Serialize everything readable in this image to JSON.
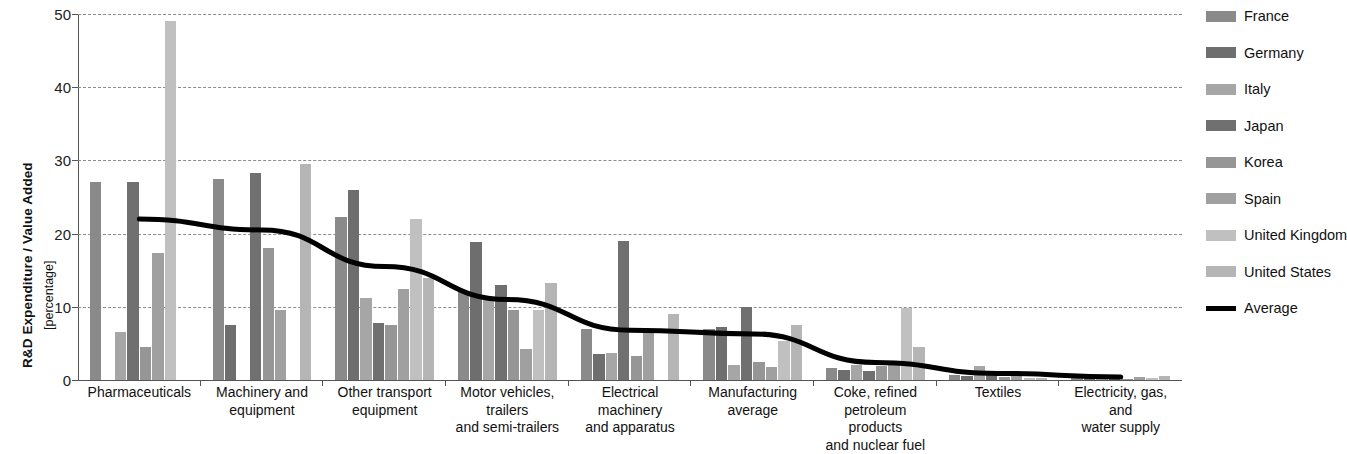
{
  "axis": {
    "y_title_main": "R&D Expenditure / Value Added",
    "y_title_sub": "[percentage]",
    "y_ticks": [
      "0",
      "10",
      "20",
      "30",
      "40",
      "50"
    ]
  },
  "legend": {
    "items": [
      {
        "label": "France",
        "color": "#8a8a8a"
      },
      {
        "label": "Germany",
        "color": "#6e6e6e"
      },
      {
        "label": "Italy",
        "color": "#a6a6a6"
      },
      {
        "label": "Japan",
        "color": "#707070"
      },
      {
        "label": "Korea",
        "color": "#969696"
      },
      {
        "label": "Spain",
        "color": "#a0a0a0"
      },
      {
        "label": "United Kingdom",
        "color": "#c0c0c0"
      },
      {
        "label": "United States",
        "color": "#b5b5b5"
      },
      {
        "label": "Average",
        "color": "#000000"
      }
    ]
  },
  "chart_data": {
    "type": "bar",
    "title": "",
    "xlabel": "",
    "ylabel": "R&D Expenditure / Value Added [percentage]",
    "ylim": [
      0,
      50
    ],
    "ytick_step": 10,
    "grid": true,
    "legend_position": "right",
    "categories": [
      "Pharmaceuticals",
      "Machinery and equipment",
      "Other transport equipment",
      "Motor vehicles, trailers and semi-trailers",
      "Electrical machinery and apparatus",
      "Manufacturing average",
      "Coke, refined petroleum products and nuclear fuel",
      "Textiles",
      "Electricity, gas, and water supply"
    ],
    "category_lines": [
      [
        "Pharmaceuticals"
      ],
      [
        "Machinery and",
        "equipment"
      ],
      [
        "Other transport",
        "equipment"
      ],
      [
        "Motor vehicles,",
        "trailers",
        "and semi-trailers"
      ],
      [
        "Electrical",
        "machinery",
        "and apparatus"
      ],
      [
        "Manufacturing",
        "average"
      ],
      [
        "Coke, refined",
        "petroleum products",
        "and nuclear fuel"
      ],
      [
        "Textiles"
      ],
      [
        "Electricity, gas, and",
        "water supply"
      ]
    ],
    "series": [
      {
        "name": "France",
        "color": "#8a8a8a",
        "values": [
          27.0,
          27.5,
          22.3,
          12.2,
          7.0,
          7.0,
          1.6,
          0.7,
          0.5
        ]
      },
      {
        "name": "Germany",
        "color": "#6e6e6e",
        "values": [
          0.0,
          7.5,
          26.0,
          18.8,
          3.5,
          7.2,
          1.3,
          0.5,
          0.3
        ]
      },
      {
        "name": "Italy",
        "color": "#a6a6a6",
        "values": [
          6.5,
          0.0,
          11.2,
          11.3,
          3.7,
          2.0,
          2.0,
          1.9,
          0.3
        ]
      },
      {
        "name": "Japan",
        "color": "#707070",
        "values": [
          27.0,
          28.3,
          7.8,
          13.0,
          19.0,
          10.0,
          1.2,
          1.1,
          0.3
        ]
      },
      {
        "name": "Korea",
        "color": "#969696",
        "values": [
          4.5,
          18.0,
          7.5,
          9.5,
          3.3,
          2.4,
          1.9,
          0.4,
          0.2
        ]
      },
      {
        "name": "Spain",
        "color": "#a0a0a0",
        "values": [
          17.3,
          9.5,
          12.5,
          4.2,
          6.8,
          1.8,
          2.3,
          0.8,
          0.4
        ]
      },
      {
        "name": "United Kingdom",
        "color": "#c0c0c0",
        "values": [
          49.0,
          0.0,
          22.0,
          9.5,
          0.0,
          5.3,
          9.8,
          0.3,
          0.3
        ]
      },
      {
        "name": "United States",
        "color": "#b5b5b5",
        "values": [
          0.0,
          29.5,
          14.0,
          13.2,
          9.0,
          7.5,
          4.5,
          0.3,
          0.5
        ]
      }
    ],
    "average_line": {
      "name": "Average",
      "color": "#000000",
      "values": [
        22.0,
        20.5,
        15.5,
        11.0,
        6.8,
        6.3,
        2.4,
        0.9,
        0.4
      ]
    }
  }
}
